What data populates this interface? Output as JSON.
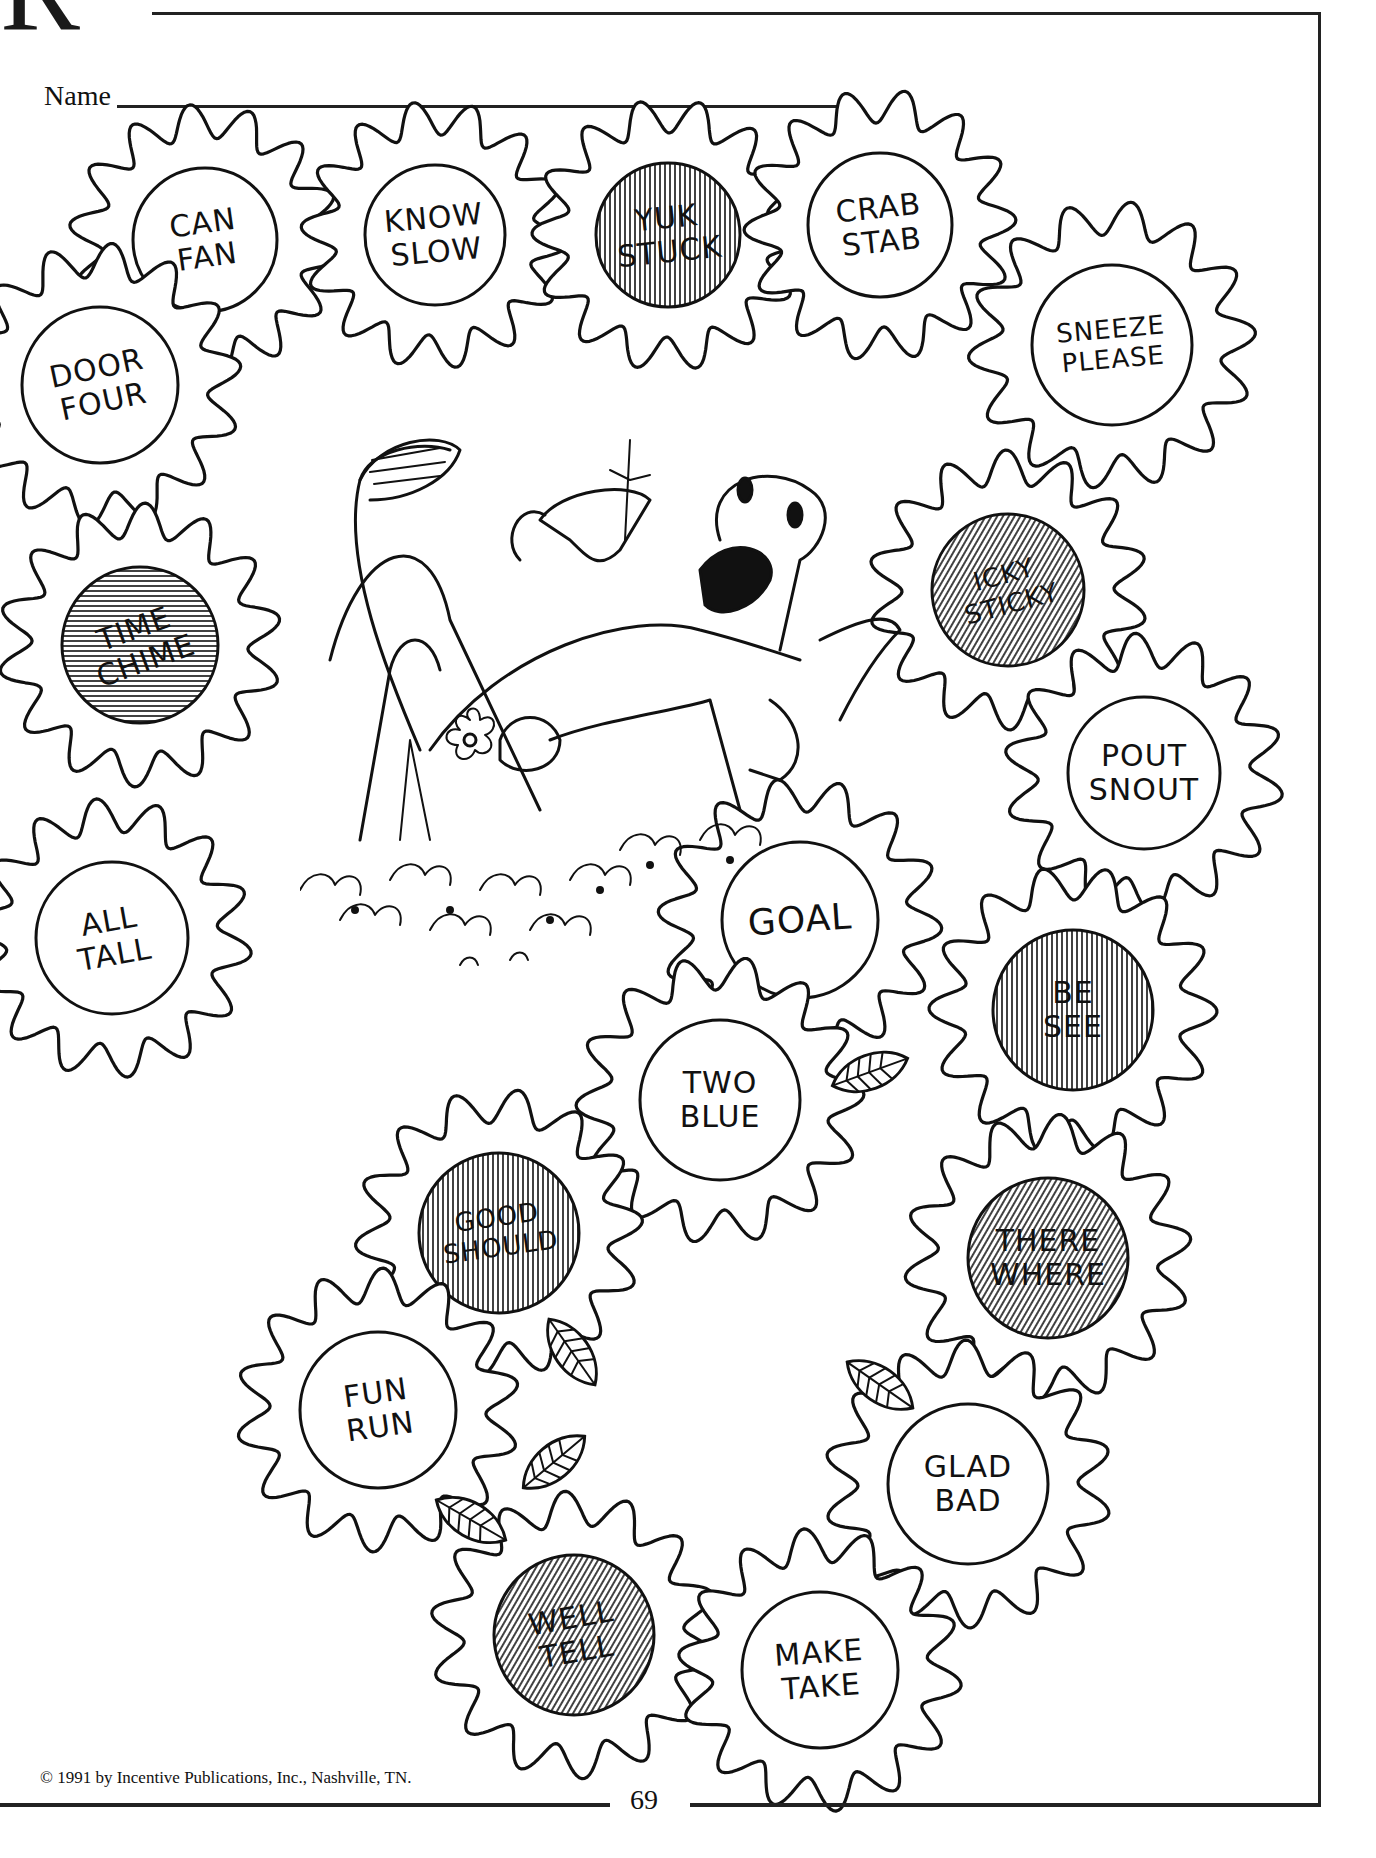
{
  "header": {
    "letter_fragment": "R",
    "name_label": "Name"
  },
  "footer": {
    "copyright": "© 1991 by Incentive Publications, Inc., Nashville, TN.",
    "page_number": "69"
  },
  "colors": {
    "ink": "#111111",
    "paper": "#ffffff",
    "shaded_fill": "#7a7a7a"
  },
  "illustration": {
    "subject": "smiling dinosaur lying on its back among flowers holding a flower"
  },
  "flowers": [
    {
      "id": "can-fan",
      "words": [
        "CAN",
        "FAN"
      ],
      "shaded": false,
      "cx": 205,
      "cy": 240,
      "r": 72,
      "rot": -8
    },
    {
      "id": "know-slow",
      "words": [
        "KNOW",
        "SLOW"
      ],
      "shaded": false,
      "cx": 435,
      "cy": 235,
      "r": 70,
      "rot": -5
    },
    {
      "id": "yuk-stuck",
      "words": [
        "YUK",
        "STUCK"
      ],
      "shaded": true,
      "cx": 668,
      "cy": 235,
      "r": 72,
      "rot": -6,
      "hatch": "vertical"
    },
    {
      "id": "crab-stab",
      "words": [
        "CRAB",
        "STAB"
      ],
      "shaded": false,
      "cx": 880,
      "cy": 225,
      "r": 72,
      "rot": -6
    },
    {
      "id": "sneeze-please",
      "words": [
        "SNEEZE",
        "PLEASE"
      ],
      "shaded": false,
      "cx": 1112,
      "cy": 345,
      "r": 80,
      "rot": -5
    },
    {
      "id": "door-four",
      "words": [
        "DOOR",
        "FOUR"
      ],
      "shaded": false,
      "cx": 100,
      "cy": 385,
      "r": 78,
      "rot": -12
    },
    {
      "id": "time-chime",
      "words": [
        "TIME",
        "CHIME"
      ],
      "shaded": true,
      "cx": 140,
      "cy": 645,
      "r": 78,
      "rot": -20,
      "hatch": "horizontal"
    },
    {
      "id": "icky-sticky",
      "words": [
        "ICKY",
        "STICKY"
      ],
      "shaded": true,
      "cx": 1008,
      "cy": 590,
      "r": 76,
      "rot": -15,
      "hatch": "diagonal"
    },
    {
      "id": "pout-snout",
      "words": [
        "POUT",
        "SNOUT"
      ],
      "shaded": false,
      "cx": 1144,
      "cy": 773,
      "r": 76,
      "rot": 0
    },
    {
      "id": "all-tall",
      "words": [
        "ALL",
        "TALL"
      ],
      "shaded": false,
      "cx": 112,
      "cy": 938,
      "r": 76,
      "rot": -10
    },
    {
      "id": "goal",
      "words": [
        "GOAL"
      ],
      "shaded": false,
      "cx": 800,
      "cy": 920,
      "r": 78,
      "rot": -4
    },
    {
      "id": "be-see",
      "words": [
        "BE",
        "SEE"
      ],
      "shaded": true,
      "cx": 1073,
      "cy": 1010,
      "r": 80,
      "rot": 0,
      "hatch": "vertical"
    },
    {
      "id": "two-blue",
      "words": [
        "TWO",
        "BLUE"
      ],
      "shaded": false,
      "cx": 720,
      "cy": 1100,
      "r": 80,
      "rot": 0
    },
    {
      "id": "good-should",
      "words": [
        "GOOD",
        "SHOULD"
      ],
      "shaded": true,
      "cx": 499,
      "cy": 1233,
      "r": 80,
      "rot": -8,
      "hatch": "vertical"
    },
    {
      "id": "there-where",
      "words": [
        "THERE",
        "WHERE"
      ],
      "shaded": true,
      "cx": 1048,
      "cy": 1258,
      "r": 80,
      "rot": 0,
      "hatch": "diagonal"
    },
    {
      "id": "fun-run",
      "words": [
        "FUN",
        "RUN"
      ],
      "shaded": false,
      "cx": 378,
      "cy": 1410,
      "r": 78,
      "rot": -8
    },
    {
      "id": "glad-bad",
      "words": [
        "GLAD",
        "BAD"
      ],
      "shaded": false,
      "cx": 968,
      "cy": 1484,
      "r": 80,
      "rot": 0
    },
    {
      "id": "well-tell",
      "words": [
        "WELL",
        "TELL"
      ],
      "shaded": true,
      "cx": 574,
      "cy": 1635,
      "r": 80,
      "rot": -10,
      "hatch": "diagonal"
    },
    {
      "id": "make-take",
      "words": [
        "MAKE",
        "TAKE"
      ],
      "shaded": false,
      "cx": 820,
      "cy": 1670,
      "r": 78,
      "rot": -4
    }
  ],
  "leaves": [
    {
      "cx": 870,
      "cy": 1072,
      "rot": -20
    },
    {
      "cx": 572,
      "cy": 1352,
      "rot": 55
    },
    {
      "cx": 554,
      "cy": 1462,
      "rot": -40
    },
    {
      "cx": 471,
      "cy": 1520,
      "rot": 30
    },
    {
      "cx": 880,
      "cy": 1385,
      "rot": 35
    }
  ]
}
